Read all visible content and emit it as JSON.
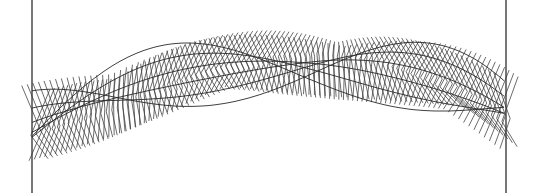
{
  "artwork": {
    "subject": "generative line-art twisted ribbon of zig-zag strokes between two vertical frame lines",
    "colors": {
      "background": "#ffffff",
      "stroke": "#3a3a3a",
      "frame": "#555555"
    },
    "strand_count": 95,
    "edge_line_count": 6
  }
}
